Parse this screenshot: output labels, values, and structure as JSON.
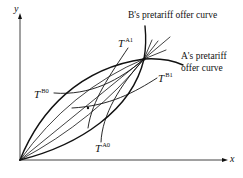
{
  "figure": {
    "axes": {
      "x_label": "x",
      "y_label": "y"
    },
    "curve_labels": {
      "b_offer": "B's pretariff offer curve",
      "a_offer_line1": "A's pretariff",
      "a_offer_line2": "offer curve"
    },
    "indifference_labels": {
      "ta1": {
        "base": "T",
        "sup": "A1"
      },
      "ta0": {
        "base": "T",
        "sup": "A0"
      },
      "tb0": {
        "base": "T",
        "sup": "B0"
      },
      "tb1": {
        "base": "T",
        "sup": "B1"
      }
    },
    "colors": {
      "line": "#111111",
      "background": "#ffffff"
    }
  }
}
